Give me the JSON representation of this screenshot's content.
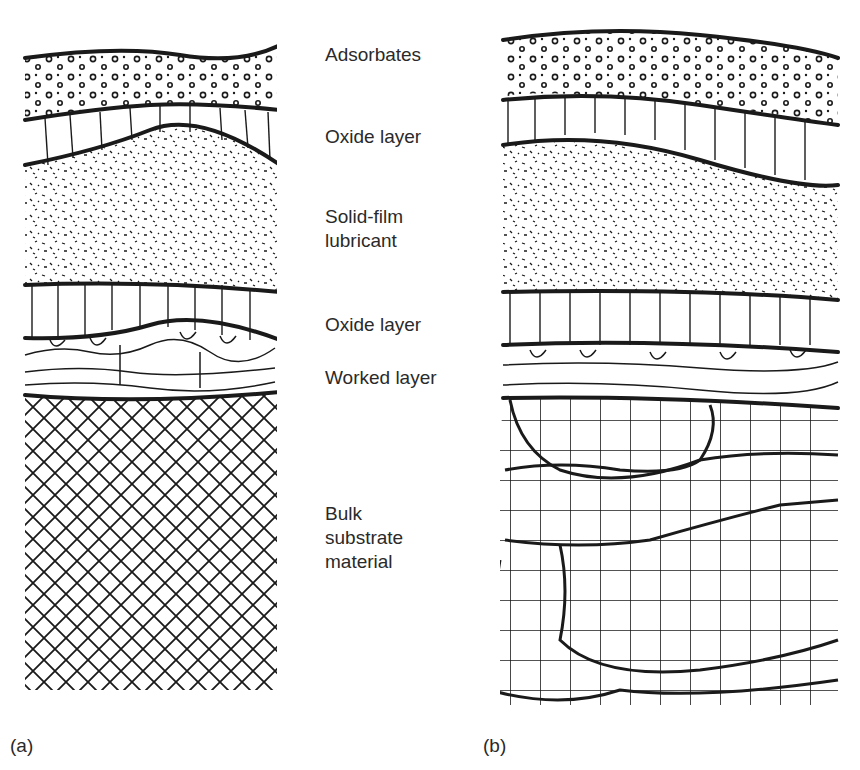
{
  "figure": {
    "labels": [
      {
        "text": "Adsorbates",
        "x": 325,
        "y": 44
      },
      {
        "text": "Oxide layer",
        "x": 325,
        "y": 126
      },
      {
        "text": "Solid-film",
        "x": 325,
        "y": 206
      },
      {
        "text": "lubricant",
        "x": 325,
        "y": 230
      },
      {
        "text": "Oxide layer",
        "x": 325,
        "y": 314
      },
      {
        "text": "Worked layer",
        "x": 325,
        "y": 367
      },
      {
        "text": "Bulk",
        "x": 325,
        "y": 503
      },
      {
        "text": "substrate",
        "x": 325,
        "y": 527
      },
      {
        "text": "material",
        "x": 325,
        "y": 551
      }
    ],
    "panels": [
      {
        "tag": "(a)",
        "x": 10,
        "y": 735
      },
      {
        "tag": "(b)",
        "x": 483,
        "y": 735
      }
    ],
    "colors": {
      "ink": "#1a1a1a",
      "background": "#ffffff"
    }
  }
}
